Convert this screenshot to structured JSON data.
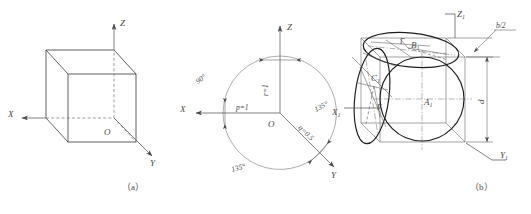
{
  "sheet": {
    "title": "Axonometric projection construction figures",
    "captions": [
      {
        "id": "caption-a",
        "text": "（a）"
      },
      {
        "id": "caption-b",
        "text": "（b）"
      }
    ]
  },
  "figure_a": {
    "name": "isometric-cube-axes",
    "caption": "（a）",
    "axis_labels": [
      {
        "name": "axis-label-x",
        "text": "X"
      },
      {
        "name": "axis-label-y",
        "text": "Y"
      },
      {
        "name": "axis-label-z",
        "text": "Z"
      }
    ],
    "origin_label": "O"
  },
  "figure_middle": {
    "name": "axonometric-coefficient-circle",
    "axis_labels": [
      {
        "name": "axis-label-x",
        "text": "X"
      },
      {
        "name": "axis-label-y",
        "text": "Y"
      },
      {
        "name": "axis-label-z",
        "text": "Z"
      }
    ],
    "origin_label": "O",
    "angles": [
      {
        "name": "angle-xz",
        "text": "90°"
      },
      {
        "name": "angle-zy",
        "text": "135°"
      },
      {
        "name": "angle-xy",
        "text": "135°"
      }
    ],
    "coefficients": [
      {
        "name": "coefficient-p",
        "text": "p=1"
      },
      {
        "name": "coefficient-q",
        "text": "q=0.5"
      },
      {
        "name": "coefficient-r",
        "text": "r=1"
      }
    ]
  },
  "figure_b": {
    "name": "cube-with-inscribed-ellipses",
    "caption": "（b）",
    "axis_labels": [
      {
        "name": "axis-label-x1",
        "text": "X",
        "sub": "1"
      },
      {
        "name": "axis-label-y1",
        "text": "Y",
        "sub": "1"
      },
      {
        "name": "axis-label-z1",
        "text": "Z",
        "sub": "1"
      }
    ],
    "ellipse_labels": [
      {
        "name": "ellipse-label-a1",
        "text": "A",
        "sub": "1"
      },
      {
        "name": "ellipse-label-b1",
        "text": "B",
        "sub": "1"
      },
      {
        "name": "ellipse-label-c1",
        "text": "C",
        "sub": "1"
      }
    ],
    "gamma_labels": [
      {
        "name": "gamma-label-top",
        "text": "Γ"
      },
      {
        "name": "gamma-label-left",
        "text": "Γ"
      }
    ],
    "dimensions": [
      {
        "name": "dimension-b-half",
        "text": "b/2"
      },
      {
        "name": "dimension-d",
        "text": "d"
      }
    ]
  },
  "colors": {
    "line": "#3a3a3a",
    "thick_line": "#1d1d1d",
    "thin_line": "#5a5a5a",
    "text": "#4a4a4a",
    "background": "#ffffff"
  }
}
